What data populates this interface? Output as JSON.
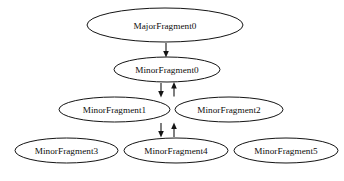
{
  "diagram": {
    "background_color": "#ffffff",
    "node_fill": "#ffffff",
    "node_stroke": "#141414",
    "edge_color": "#151515",
    "nodes": [
      {
        "id": "major0",
        "label": "MajorFragment0",
        "cx": 165,
        "cy": 25,
        "rx": 78,
        "ry": 17
      },
      {
        "id": "minor0",
        "label": "MinorFragment0",
        "cx": 167,
        "cy": 69.5,
        "rx": 53,
        "ry": 12.5
      },
      {
        "id": "minor1",
        "label": "MinorFragment1",
        "cx": 114.5,
        "cy": 109.5,
        "rx": 55.5,
        "ry": 12.5
      },
      {
        "id": "minor2",
        "label": "MinorFragment2",
        "cx": 229,
        "cy": 109.5,
        "rx": 54,
        "ry": 12.5
      },
      {
        "id": "minor3",
        "label": "MinorFragment3",
        "cx": 66.5,
        "cy": 150.5,
        "rx": 51.5,
        "ry": 12.5
      },
      {
        "id": "minor4",
        "label": "MinorFragment4",
        "cx": 176,
        "cy": 150.5,
        "rx": 52,
        "ry": 12.5
      },
      {
        "id": "minor5",
        "label": "MinorFragment5",
        "cx": 286,
        "cy": 150.5,
        "rx": 52,
        "ry": 12.5
      }
    ],
    "edges": [
      {
        "id": "e-major0-minor0",
        "from": "major0",
        "to": "minor0",
        "x": 166,
        "y1": 43,
        "y2": 56.5,
        "direction": "down"
      },
      {
        "id": "e-minor0-minor1",
        "from": "minor0",
        "to": "minor1",
        "x": 161,
        "y1": 83,
        "y2": 96.5,
        "direction": "down"
      },
      {
        "id": "e-minor2-minor0",
        "from": "minor2",
        "to": "minor0",
        "x": 174,
        "y1": 96.5,
        "y2": 83,
        "direction": "up"
      },
      {
        "id": "e-minor1-minor4",
        "from": "minor1",
        "to": "minor4",
        "x": 161,
        "y1": 123,
        "y2": 137,
        "direction": "down"
      },
      {
        "id": "e-minor4-minor2",
        "from": "minor4",
        "to": "minor2",
        "x": 174,
        "y1": 137,
        "y2": 123,
        "direction": "up"
      }
    ]
  }
}
